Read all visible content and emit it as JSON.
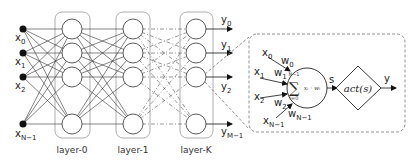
{
  "diagram": {
    "inputs": [
      {
        "base": "x",
        "sub": "0",
        "y": 29
      },
      {
        "base": "x",
        "sub": "1",
        "y": 53
      },
      {
        "base": "x",
        "sub": "2",
        "y": 77
      },
      {
        "base": "x",
        "sub": "N−1",
        "y": 124
      }
    ],
    "layers": [
      {
        "label": "layer-0",
        "x": 72
      },
      {
        "label": "layer-1",
        "x": 133
      },
      {
        "label": "layer-K",
        "x": 196
      }
    ],
    "node_rows": [
      29,
      53,
      77,
      124
    ],
    "outputs": [
      {
        "base": "y",
        "sub": "0"
      },
      {
        "base": "y",
        "sub": "1"
      },
      {
        "base": "y",
        "sub": "2"
      },
      {
        "base": "y",
        "sub": "M−1"
      }
    ],
    "neuron": {
      "inputs": [
        {
          "x_base": "x",
          "x_sub": "0",
          "w_base": "w",
          "w_sub": "0"
        },
        {
          "x_base": "x",
          "x_sub": "1",
          "w_base": "w",
          "w_sub": "1"
        },
        {
          "x_base": "x",
          "x_sub": "2",
          "w_base": "w",
          "w_sub": "2"
        },
        {
          "x_base": "x",
          "x_sub": "N−1",
          "w_base": "w",
          "w_sub": "N−1"
        }
      ],
      "sum_upper": "N−1",
      "sum_lower": "i=0",
      "sum_symbol": "∑",
      "sum_term": "xᵢ · wᵢ",
      "sum_output_label": "s",
      "activation_label": "act(s)",
      "output_label": "y"
    },
    "colors": {
      "stroke": "#333333",
      "layer_box": "#888888",
      "dashed": "#666666"
    }
  }
}
